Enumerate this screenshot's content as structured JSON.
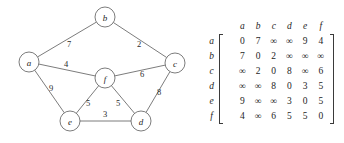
{
  "figure": {
    "background": "#ffffff",
    "ink": "#3a3a3a"
  },
  "graph": {
    "type": "weighted-undirected-graph",
    "nodes": [
      {
        "id": "a",
        "label": "a",
        "cx": 29,
        "cy": 62,
        "r": 10
      },
      {
        "id": "b",
        "label": "b",
        "cx": 105,
        "cy": 17,
        "r": 10
      },
      {
        "id": "c",
        "label": "c",
        "cx": 175,
        "cy": 63,
        "r": 10
      },
      {
        "id": "d",
        "label": "d",
        "cx": 141,
        "cy": 121,
        "r": 10
      },
      {
        "id": "e",
        "label": "e",
        "cx": 70,
        "cy": 121,
        "r": 10
      },
      {
        "id": "f",
        "label": "f",
        "cx": 105,
        "cy": 78,
        "r": 10
      }
    ],
    "edges": [
      {
        "from": "a",
        "to": "b",
        "weight": "7",
        "lx": 69,
        "ly": 44
      },
      {
        "from": "b",
        "to": "c",
        "weight": "2",
        "lx": 139,
        "ly": 44
      },
      {
        "from": "a",
        "to": "f",
        "weight": "4",
        "lx": 66,
        "ly": 64
      },
      {
        "from": "f",
        "to": "c",
        "weight": "6",
        "lx": 142,
        "ly": 74
      },
      {
        "from": "a",
        "to": "e",
        "weight": "9",
        "lx": 51,
        "ly": 88
      },
      {
        "from": "e",
        "to": "f",
        "weight": "5",
        "lx": 88,
        "ly": 103
      },
      {
        "from": "f",
        "to": "d",
        "weight": "5",
        "lx": 118,
        "ly": 103
      },
      {
        "from": "c",
        "to": "d",
        "weight": "8",
        "lx": 159,
        "ly": 92
      },
      {
        "from": "e",
        "to": "d",
        "weight": "3",
        "lx": 105,
        "ly": 114
      }
    ]
  },
  "matrix": {
    "col_headers": [
      "a",
      "b",
      "c",
      "d",
      "e",
      "f"
    ],
    "row_headers": [
      "a",
      "b",
      "c",
      "d",
      "e",
      "f"
    ],
    "rows": [
      [
        "0",
        "7",
        "∞",
        "∞",
        "9",
        "4"
      ],
      [
        "7",
        "0",
        "2",
        "∞",
        "∞",
        "∞"
      ],
      [
        "∞",
        "2",
        "0",
        "8",
        "∞",
        "6"
      ],
      [
        "∞",
        "∞",
        "8",
        "0",
        "3",
        "5"
      ],
      [
        "9",
        "∞",
        "∞",
        "3",
        "0",
        "5"
      ],
      [
        "4",
        "∞",
        "6",
        "5",
        "5",
        "0"
      ]
    ]
  }
}
